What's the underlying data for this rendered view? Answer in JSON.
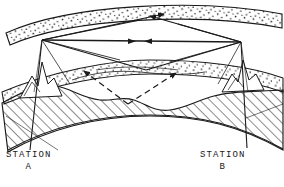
{
  "figure": {
    "type": "ionospheric-radio-propagation-diagram",
    "background_color": "#ffffff",
    "ink_color": "#1a1a1a"
  },
  "labels": {
    "station_a": {
      "name": "STATION",
      "letter": "A"
    },
    "station_b": {
      "name": "STATION",
      "letter": "B"
    }
  },
  "layers": [
    {
      "id": "ionosphere",
      "name": "ionosphere-band",
      "fill": "stipple",
      "stroke": "#1a1a1a"
    },
    {
      "id": "atmosphere",
      "name": "cloud-band",
      "fill": "stipple",
      "stroke": "#1a1a1a"
    },
    {
      "id": "earth",
      "name": "earth-ground",
      "fill": "diagonal-hatch",
      "stroke": "#1a1a1a"
    }
  ],
  "paths": [
    {
      "id": "direct",
      "name": "direct-line-of-sight-path",
      "style": "solid",
      "arrows": "bidirectional"
    },
    {
      "id": "sky-up-left",
      "name": "skywave-ascending-from-a",
      "style": "solid",
      "arrows": "right"
    },
    {
      "id": "sky-down-right",
      "name": "skywave-descending-to-b",
      "style": "solid",
      "arrows": "left"
    },
    {
      "id": "ground-reflect",
      "name": "ground-reflected-path",
      "style": "solid",
      "arrows": "none"
    },
    {
      "id": "subsurface",
      "name": "subsurface-refracted-path",
      "style": "dashed",
      "arrows": "both-ends"
    }
  ],
  "markers": {
    "arrowhead": "triangle-filled"
  }
}
